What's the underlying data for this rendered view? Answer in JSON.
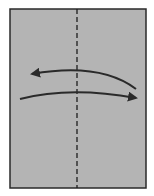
{
  "diagram": {
    "type": "origami-fold-step",
    "paper": {
      "x": 10,
      "y": 9,
      "width": 136,
      "height": 179,
      "fill": "#b4b4b4",
      "stroke": "#2a2a2a"
    },
    "fold_line": {
      "style": "valley-dashed",
      "x": 77,
      "y1": 9,
      "y2": 188,
      "stroke": "#1e1e1e"
    },
    "arrows": [
      {
        "name": "fold-arrow-left",
        "direction": "right-to-left",
        "path": "M136,89 Q100,62 32,74",
        "head_at": [
          32,
          74
        ]
      },
      {
        "name": "fold-arrow-right",
        "direction": "left-to-right",
        "path": "M20,99 Q70,86 136,98",
        "head_at": [
          136,
          98
        ]
      }
    ],
    "colors": {
      "arrow": "#2a2a2a",
      "background": "#ffffff"
    }
  }
}
